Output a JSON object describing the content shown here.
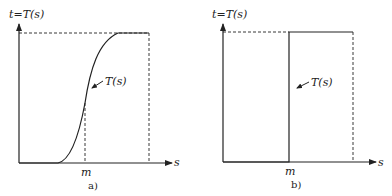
{
  "panels": [
    {
      "id": "a",
      "caption": "a)",
      "y_axis_label": "t=T(s)",
      "x_axis_label": "s",
      "curve_label": "T(s)",
      "tick_label": "m",
      "curve_type": "sigmoid"
    },
    {
      "id": "b",
      "caption": "b)",
      "y_axis_label": "t=T(s)",
      "x_axis_label": "s",
      "curve_label": "T(s)",
      "tick_label": "m",
      "curve_type": "step"
    }
  ],
  "colors": {
    "line": "#222222",
    "background": "#ffffff"
  }
}
